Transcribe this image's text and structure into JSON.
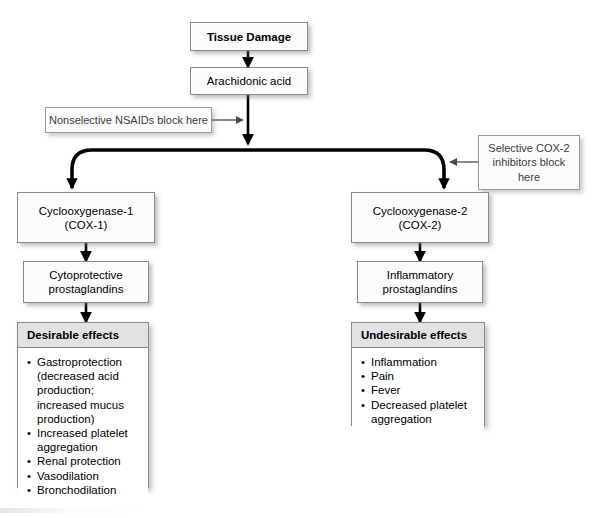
{
  "diagram": {
    "colors": {
      "box_fill": "#fbfbfb",
      "box_border": "#8a8a8a",
      "panel_header_fill": "#e2e2e2",
      "edge_thin": "#4a4a4a",
      "edge_thick": "#000000",
      "callout_text": "#3b3b3b"
    },
    "nodes": {
      "tissue_damage": {
        "label": "Tissue Damage"
      },
      "arachidonic_acid": {
        "label": "Arachidonic acid"
      },
      "cox1": {
        "line1": "Cyclooxygenase-1",
        "line2": "(COX-1)"
      },
      "cox2": {
        "line1": "Cyclooxygenase-2",
        "line2": "(COX-2)"
      },
      "cytoprotective": {
        "line1": "Cytoprotective",
        "line2": "prostaglandins"
      },
      "inflammatory": {
        "line1": "Inflammatory",
        "line2": "prostaglandins"
      }
    },
    "callouts": {
      "nonselective_nsaids": {
        "line1": "Nonselective NSAIDs block here"
      },
      "selective_cox2": {
        "line1": "Selective COX-2",
        "line2": "inhibitors block",
        "line3": "here"
      }
    },
    "panels": {
      "desirable": {
        "header": "Desirable effects",
        "items": [
          {
            "text": "Gastroprotection",
            "sub": [
              "(decreased acid",
              "production;",
              "increased mucus",
              "production)"
            ]
          },
          {
            "text": "Increased platelet",
            "sub": [
              "aggregation"
            ]
          },
          {
            "text": "Renal protection",
            "sub": []
          },
          {
            "text": "Vasodilation",
            "sub": []
          },
          {
            "text": "Bronchodilation",
            "sub": []
          }
        ]
      },
      "undesirable": {
        "header": "Undesirable effects",
        "items": [
          {
            "text": "Inflammation",
            "sub": []
          },
          {
            "text": "Pain",
            "sub": []
          },
          {
            "text": "Fever",
            "sub": []
          },
          {
            "text": "Decreased platelet",
            "sub": [
              "aggregation"
            ]
          }
        ]
      }
    }
  }
}
